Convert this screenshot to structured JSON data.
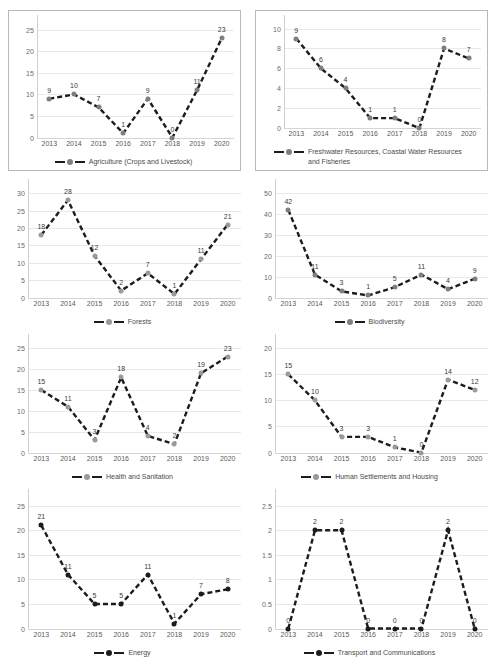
{
  "page": {
    "background": "#ffffff",
    "layout": "4 rows x 2 columns of line charts"
  },
  "style": {
    "line_color": "#1c1c1c",
    "marker_gray": "#7f7f7f",
    "marker_dark": "#1c1c1c",
    "gridline_color": "#e9e9e9",
    "axis_text_color": "#6b6b6b"
  },
  "charts": [
    {
      "id": "agriculture",
      "legend": "Agriculture (Crops and Livestock)",
      "bordered": true,
      "marker_color": "#7f7f7f",
      "chart_data": {
        "type": "line",
        "title": "",
        "xlabel": "",
        "ylabel": "",
        "categories": [
          "2013",
          "2014",
          "2015",
          "2016",
          "2017",
          "2018",
          "2019",
          "2020"
        ],
        "values": [
          9,
          10,
          7,
          1,
          9,
          0,
          11,
          23
        ],
        "yticks": [
          0,
          5,
          10,
          15,
          20,
          25
        ],
        "ylim": [
          0,
          25
        ],
        "grid": true,
        "legend_position": "bottom",
        "series": [
          {
            "name": "Agriculture (Crops and Livestock)",
            "values": [
              9,
              10,
              7,
              1,
              9,
              0,
              11,
              23
            ]
          }
        ]
      }
    },
    {
      "id": "freshwater",
      "legend": "Freshwater Resources, Coastal Water Resources and Fisheries",
      "bordered": true,
      "marker_color": "#7f7f7f",
      "chart_data": {
        "type": "line",
        "title": "",
        "xlabel": "",
        "ylabel": "",
        "categories": [
          "2013",
          "2014",
          "2015",
          "2016",
          "2017",
          "2018",
          "2019",
          "2020"
        ],
        "values": [
          9,
          6,
          4,
          1,
          1,
          0,
          8,
          7
        ],
        "yticks": [
          0,
          2,
          4,
          6,
          8,
          10
        ],
        "ylim": [
          0,
          10
        ],
        "grid": true,
        "legend_position": "bottom",
        "series": [
          {
            "name": "Freshwater Resources, Coastal Water Resources and Fisheries",
            "values": [
              9,
              6,
              4,
              1,
              1,
              0,
              8,
              7
            ]
          }
        ]
      }
    },
    {
      "id": "forests",
      "legend": "Forests",
      "bordered": false,
      "marker_color": "#9a9a9a",
      "chart_data": {
        "type": "line",
        "title": "",
        "xlabel": "",
        "ylabel": "",
        "categories": [
          "2013",
          "2014",
          "2015",
          "2016",
          "2017",
          "2018",
          "2019",
          "2020"
        ],
        "values": [
          18,
          28,
          12,
          2,
          7,
          1,
          11,
          21
        ],
        "yticks": [
          0,
          5,
          10,
          15,
          20,
          25,
          30
        ],
        "ylim": [
          0,
          30
        ],
        "grid": true,
        "legend_position": "bottom",
        "series": [
          {
            "name": "Forests",
            "values": [
              18,
              28,
              12,
              2,
              7,
              1,
              11,
              21
            ]
          }
        ]
      }
    },
    {
      "id": "biodiversity",
      "legend": "Biodiversity",
      "bordered": false,
      "marker_color": "#7f7f7f",
      "chart_data": {
        "type": "line",
        "title": "",
        "xlabel": "",
        "ylabel": "",
        "categories": [
          "2013",
          "2014",
          "2015",
          "2016",
          "2017",
          "2018",
          "2019",
          "2020"
        ],
        "values": [
          42,
          11,
          3,
          1,
          5,
          11,
          4,
          9
        ],
        "yticks": [
          0,
          10,
          20,
          30,
          40,
          50
        ],
        "ylim": [
          0,
          50
        ],
        "grid": true,
        "legend_position": "bottom",
        "series": [
          {
            "name": "Biodiversity",
            "values": [
              42,
              11,
              3,
              1,
              5,
              11,
              4,
              9
            ]
          }
        ]
      }
    },
    {
      "id": "health-sanitation",
      "legend": "Health and Sanitation",
      "bordered": false,
      "marker_color": "#9a9a9a",
      "chart_data": {
        "type": "line",
        "title": "",
        "xlabel": "",
        "ylabel": "",
        "categories": [
          "2013",
          "2014",
          "2015",
          "2016",
          "2017",
          "2018",
          "2019",
          "2020"
        ],
        "values": [
          15,
          11,
          3,
          18,
          4,
          2,
          19,
          23
        ],
        "yticks": [
          0,
          5,
          10,
          15,
          20,
          25
        ],
        "ylim": [
          0,
          25
        ],
        "grid": true,
        "legend_position": "bottom",
        "series": [
          {
            "name": "Health and Sanitation",
            "values": [
              15,
              11,
              3,
              18,
              4,
              2,
              19,
              23
            ]
          }
        ]
      }
    },
    {
      "id": "human-settlements",
      "legend": "Human Settlements and Housing",
      "bordered": false,
      "marker_color": "#9a9a9a",
      "chart_data": {
        "type": "line",
        "title": "",
        "xlabel": "",
        "ylabel": "",
        "categories": [
          "2013",
          "2014",
          "2015",
          "2016",
          "2017",
          "2018",
          "2019",
          "2020"
        ],
        "values": [
          15,
          10,
          3,
          3,
          1,
          0,
          14,
          12
        ],
        "yticks": [
          0,
          5,
          10,
          15,
          20
        ],
        "ylim": [
          0,
          20
        ],
        "grid": true,
        "legend_position": "bottom",
        "series": [
          {
            "name": "Human Settlements and Housing",
            "values": [
              15,
              10,
              3,
              3,
              1,
              0,
              14,
              12
            ]
          }
        ]
      }
    },
    {
      "id": "energy",
      "legend": "Energy",
      "bordered": false,
      "marker_color": "#1c1c1c",
      "chart_data": {
        "type": "line",
        "title": "",
        "xlabel": "",
        "ylabel": "",
        "categories": [
          "2013",
          "2014",
          "2015",
          "2016",
          "2017",
          "2018",
          "2019",
          "2020"
        ],
        "values": [
          21,
          11,
          5,
          5,
          11,
          1,
          7,
          8
        ],
        "yticks": [
          0,
          5,
          10,
          15,
          20,
          25
        ],
        "ylim": [
          0,
          25
        ],
        "grid": true,
        "legend_position": "bottom",
        "series": [
          {
            "name": "Energy",
            "values": [
              21,
              11,
              5,
              5,
              11,
              1,
              7,
              8
            ]
          }
        ]
      }
    },
    {
      "id": "transport-communications",
      "legend": "Transport and Communications",
      "bordered": false,
      "marker_color": "#1c1c1c",
      "chart_data": {
        "type": "line",
        "title": "",
        "xlabel": "",
        "ylabel": "",
        "categories": [
          "2013",
          "2014",
          "2015",
          "2016",
          "2017",
          "2018",
          "2019",
          "2020"
        ],
        "values": [
          0,
          2,
          2,
          0,
          0,
          0,
          2,
          0
        ],
        "yticks": [
          0,
          0.5,
          1,
          1.5,
          2,
          2.5
        ],
        "ytick_labels": [
          "0",
          "0.5",
          "1",
          "1.5",
          "2",
          "2.5"
        ],
        "ylim": [
          0,
          2.5
        ],
        "grid": true,
        "legend_position": "bottom",
        "series": [
          {
            "name": "Transport and Communications",
            "values": [
              0,
              2,
              2,
              0,
              0,
              0,
              2,
              0
            ]
          }
        ]
      }
    }
  ]
}
